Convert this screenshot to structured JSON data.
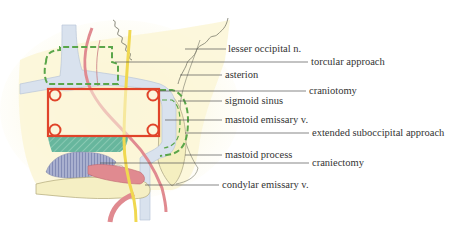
{
  "diagram": {
    "labels": [
      {
        "id": "lesser-occipital",
        "text": "lesser occipital n.",
        "x": 228,
        "y": 43,
        "line_from": 185,
        "line_to": 226,
        "line_y": 49
      },
      {
        "id": "torcular-approach",
        "text": "torcular approach",
        "x": 311,
        "y": 56,
        "line_from": 115,
        "line_to": 308,
        "line_y": 62
      },
      {
        "id": "asterion",
        "text": "asterion",
        "x": 225,
        "y": 69,
        "line_from": 180,
        "line_to": 222,
        "line_y": 75
      },
      {
        "id": "craniotomy",
        "text": "craniotomy",
        "x": 309,
        "y": 85,
        "line_from": 160,
        "line_to": 306,
        "line_y": 91
      },
      {
        "id": "sigmoid-sinus",
        "text": "sigmoid sinus",
        "x": 225,
        "y": 95,
        "line_from": 178,
        "line_to": 222,
        "line_y": 101
      },
      {
        "id": "mastoid-emissary",
        "text": "mastoid emissary v.",
        "x": 225,
        "y": 114,
        "line_from": 165,
        "line_to": 222,
        "line_y": 120
      },
      {
        "id": "extended-suboccipital",
        "text": "extended suboccipital approach",
        "x": 312,
        "y": 127,
        "line_from": 185,
        "line_to": 309,
        "line_y": 133
      },
      {
        "id": "mastoid-process",
        "text": "mastoid process",
        "x": 225,
        "y": 149,
        "line_from": 185,
        "line_to": 222,
        "line_y": 155
      },
      {
        "id": "craniectomy",
        "text": "craniectomy",
        "x": 312,
        "y": 157,
        "line_from": 100,
        "line_to": 309,
        "line_y": 163
      },
      {
        "id": "condylar-emissary",
        "text": "condylar emissary v.",
        "x": 222,
        "y": 179,
        "line_from": 145,
        "line_to": 219,
        "line_y": 185
      }
    ]
  },
  "colors": {
    "bone": "#f8f3c8",
    "bone_edge": "#e9e0a0",
    "sinus": "#d9e2ee",
    "artery": "#e08a90",
    "nerve": "#f0d850",
    "craniotomy": "#e0442a",
    "approach_dashed": "#5aa64a",
    "craniectomy_fill": "#5fb39a",
    "condyle": "#9aa3c6",
    "leader_line": "#555555",
    "text": "#333333"
  }
}
